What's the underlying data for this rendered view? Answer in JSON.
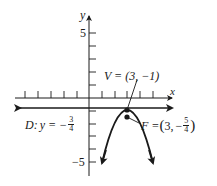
{
  "diagram": {
    "axes": {
      "x_label": "x",
      "y_label": "y",
      "y_tick_labels": [
        {
          "value": 5,
          "text": "5"
        },
        {
          "value": -5,
          "text": "−5"
        }
      ],
      "x_range": [
        -7,
        7
      ],
      "y_range": [
        -6,
        6
      ]
    },
    "vertex": {
      "label": "V = (3, −1)",
      "x": 3,
      "y": -1
    },
    "focus": {
      "prefix": "F = ",
      "x_text": "3,",
      "minus": "−",
      "num": "5",
      "den": "4",
      "x": 3,
      "y": -1.25
    },
    "directrix": {
      "prefix": "D: ",
      "eq": "y = −",
      "num": "3",
      "den": "4",
      "y": -0.75
    },
    "curve": {
      "equation": "(x − 3)^2 = −(y + 1)",
      "opens": "down"
    },
    "colors": {
      "ink": "#1a1a1a",
      "background": "#ffffff"
    }
  }
}
